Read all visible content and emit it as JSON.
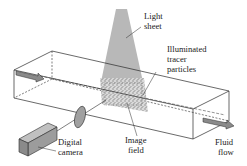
{
  "diagram": {
    "labels": {
      "light_sheet": [
        "Light",
        "sheet"
      ],
      "tracer_particles": [
        "Illuminated",
        "tracer",
        "particles"
      ],
      "image_field": [
        "Image",
        "field"
      ],
      "digital_camera": [
        "Digital",
        "camera"
      ],
      "fluid_flow": [
        "Fluid",
        "flow"
      ]
    },
    "colors": {
      "line": "#2a2a2a",
      "light_sheet": "#b8b8b8",
      "particles": "#9a9a9a",
      "lens": "#a0a0a0",
      "camera": "#9c9c9c",
      "background": "#ffffff"
    }
  }
}
